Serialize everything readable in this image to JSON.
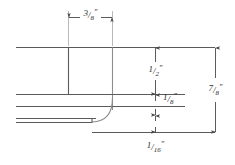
{
  "drawing": {
    "type": "engineering-cross-section",
    "title": "Stepped profile cross-section with dimensions",
    "units": "inches",
    "line_color": "#5a5a5a",
    "text_color": "#2b2b2b",
    "background": "#ffffff",
    "canvas": {
      "width": 235,
      "height": 165
    }
  },
  "dimensions": [
    {
      "id": "width-top",
      "label": "3/8\"",
      "numerator": "3",
      "denominator": "8",
      "slash": "/",
      "mark": "\"",
      "value": 0.375,
      "orientation": "horizontal",
      "position": "top",
      "extent_px": {
        "from": 68,
        "to": 112,
        "at": 17
      }
    },
    {
      "id": "height-upper-step",
      "label": "1/2\"",
      "numerator": "1",
      "denominator": "2",
      "slash": "/",
      "mark": "\"",
      "value": 0.5,
      "orientation": "vertical",
      "position": "inner-middle",
      "extent_px": {
        "from": 47,
        "to": 94,
        "at": 155
      }
    },
    {
      "id": "height-middle-band",
      "label": "1/8\"",
      "numerator": "1",
      "denominator": "8",
      "slash": "/",
      "mark": "\"",
      "value": 0.125,
      "orientation": "vertical",
      "position": "inner-lower",
      "extent_px": {
        "from": 94,
        "to": 115,
        "at": 155
      }
    },
    {
      "id": "height-bottom-band",
      "label": "1/16\"",
      "numerator": "1",
      "denominator": "16",
      "slash": "/",
      "mark": "\"",
      "value": 0.0625,
      "orientation": "vertical",
      "position": "bottom",
      "extent_px": {
        "from": 115,
        "to": 132,
        "at": 155
      }
    },
    {
      "id": "height-overall",
      "label": "7/8\"",
      "numerator": "7",
      "denominator": "8",
      "slash": "/",
      "mark": "\"",
      "value": 0.875,
      "orientation": "vertical",
      "position": "right-overall",
      "extent_px": {
        "from": 47,
        "to": 132,
        "at": 215
      }
    }
  ],
  "profile": {
    "description": "Left-extending stepped slab profile with radiused inner corner",
    "edges": [
      {
        "id": "top-surface",
        "y": 47,
        "x_from": 16,
        "x_to": 215
      },
      {
        "id": "upper-step-face",
        "x": 68,
        "y_from": 47,
        "y_to": 94
      },
      {
        "id": "mid-surface-upper",
        "y": 94,
        "x_from": 16,
        "x_to": 185
      },
      {
        "id": "mid-surface-lower",
        "y": 106,
        "x_from": 16,
        "x_to": 185
      },
      {
        "id": "fillet-vertical",
        "x": 112,
        "y_from": 47,
        "y_to": 112
      },
      {
        "id": "bottom-surface",
        "y": 122,
        "x_from": 16,
        "x_to": 92
      },
      {
        "id": "base-line",
        "y": 132,
        "x_from": 92,
        "x_to": 215
      }
    ]
  }
}
